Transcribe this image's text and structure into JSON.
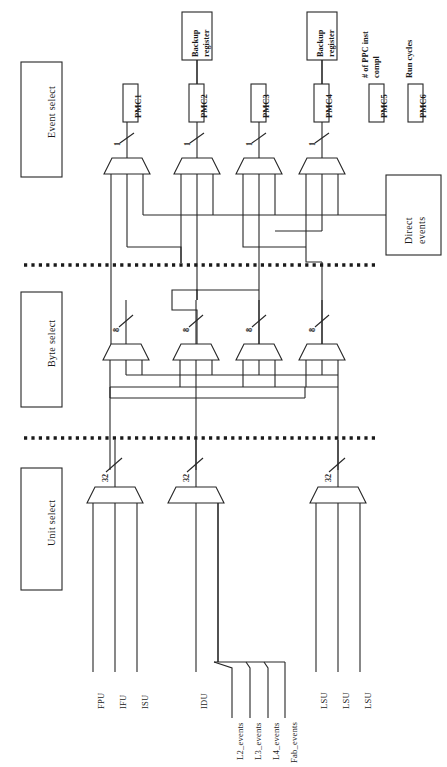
{
  "diagram": {
    "orientation": "rotated-90-ccw",
    "ink_color": "#222222",
    "background_color": "#ffffff"
  },
  "stages": [
    {
      "id": "event-select",
      "label": "Event select",
      "bus_width": "1"
    },
    {
      "id": "byte-select",
      "label": "Byte select",
      "bus_width": "8"
    },
    {
      "id": "unit-select",
      "label": "Unit select",
      "bus_width": "32"
    }
  ],
  "counters": [
    {
      "id": "pmc1",
      "label": "PMC1",
      "backup": null,
      "annotation": null
    },
    {
      "id": "pmc2",
      "label": "PMC2",
      "backup": "Backup\nregister",
      "annotation": null
    },
    {
      "id": "pmc3",
      "label": "PMC3",
      "backup": null,
      "annotation": null
    },
    {
      "id": "pmc4",
      "label": "PMC4",
      "backup": "Backup\nregister",
      "annotation": null
    },
    {
      "id": "pmc5",
      "label": "PMC5",
      "backup": null,
      "annotation": "# of PPC inst\ncompl"
    },
    {
      "id": "pmc6",
      "label": "PMC6",
      "backup": null,
      "annotation": "Run cycles"
    }
  ],
  "blocks": {
    "direct_events": {
      "label": "Direct\nevents"
    }
  },
  "bus_labels": {
    "event_select": [
      "1",
      "1",
      "1",
      "1"
    ],
    "byte_select": [
      "8",
      "8",
      "8",
      "8"
    ],
    "unit_select": [
      "32",
      "32",
      "32"
    ]
  },
  "unit_sources": [
    {
      "group": "fpu-ifu-isu",
      "signals": [
        "FPU",
        "IFU",
        "ISU"
      ]
    },
    {
      "group": "idu-nest",
      "signals": [
        "IDU"
      ]
    },
    {
      "group": "nest-events",
      "signals": [
        "L2_events",
        "L3_events",
        "L4_events",
        "Fab_events"
      ]
    },
    {
      "group": "lsu",
      "signals": [
        "LSU",
        "LSU",
        "LSU"
      ]
    }
  ],
  "signal_labels": {
    "fpu": "FPU",
    "ifu": "IFU",
    "isu": "ISU",
    "idu": "IDU",
    "l2": "L2_events",
    "l3": "L3_events",
    "l4": "L4_events",
    "fab": "Fab_events",
    "lsu1": "LSU",
    "lsu2": "LSU",
    "lsu3": "LSU"
  },
  "dividers": [
    {
      "id": "divider-event-byte",
      "style": "dotted"
    },
    {
      "id": "divider-byte-unit",
      "style": "dotted"
    }
  ]
}
